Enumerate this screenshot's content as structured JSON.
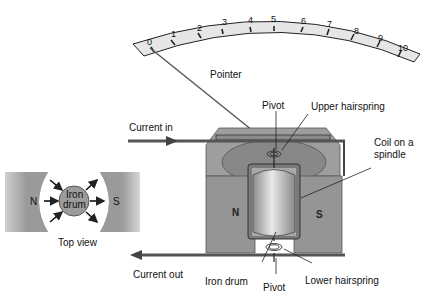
{
  "diagram": {
    "scale": {
      "ticks": [
        "0",
        "1",
        "2",
        "3",
        "4",
        "5",
        "6",
        "7",
        "8",
        "9",
        "10"
      ]
    },
    "labels": {
      "pointer": "Pointer",
      "pivot_top": "Pivot",
      "upper_hairspring": "Upper hairspring",
      "coil_line1": "Coil on a",
      "coil_line2": "spindle",
      "current_in": "Current in",
      "current_out": "Current out",
      "iron_drum": "Iron drum",
      "pivot_bottom": "Pivot",
      "lower_hairspring": "Lower hairspring",
      "pole_n": "N",
      "pole_s": "S"
    },
    "top_view": {
      "caption": "Top view",
      "pole_n": "N",
      "pole_s": "S",
      "drum_line1": "Iron",
      "drum_line2": "drum"
    },
    "colors": {
      "magnet": "#9a9a9a",
      "magnet_dark": "#7d7d7d",
      "drum": "#c8c8c8",
      "scale_bg": "#e6e6e6",
      "wire": "#666666"
    }
  }
}
